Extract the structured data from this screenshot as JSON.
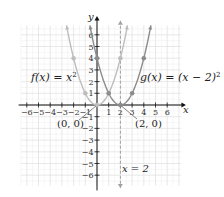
{
  "chart_data": {
    "type": "line",
    "title": "",
    "xlabel": "x",
    "ylabel": "y",
    "xlim": [
      -6.5,
      7.2
    ],
    "ylim": [
      -6.9,
      6.8
    ],
    "grid": true,
    "x_ticks": [
      -6,
      -5,
      -4,
      -3,
      -2,
      -1,
      1,
      2,
      3,
      4,
      5,
      6
    ],
    "y_ticks": [
      -6,
      -5,
      -4,
      -3,
      -2,
      -1,
      1,
      2,
      3,
      4,
      5,
      6
    ],
    "series": [
      {
        "name": "f(x) = x^2",
        "label_main": "f(x) = x",
        "label_exp": "2",
        "color": "#bdbdbd",
        "points": [
          [
            -2,
            4
          ],
          [
            -1,
            1
          ],
          [
            0,
            0
          ],
          [
            1,
            1
          ],
          [
            2,
            4
          ]
        ]
      },
      {
        "name": "g(x) = (x − 2)^2",
        "label_main": "g(x) = (x − 2)",
        "label_exp": "2",
        "color": "#8c8c8c",
        "points": [
          [
            0,
            4
          ],
          [
            1,
            1
          ],
          [
            2,
            0
          ],
          [
            3,
            1
          ],
          [
            4,
            4
          ]
        ]
      }
    ],
    "annotations": [
      {
        "text": "(0, 0)",
        "points_to": [
          0,
          0
        ]
      },
      {
        "text": "(2, 0)",
        "points_to": [
          2,
          0
        ]
      },
      {
        "text": "x = 2",
        "type": "axis-of-symmetry",
        "x": 2
      }
    ]
  },
  "labels": {
    "x_axis": "x",
    "y_axis": "y",
    "f_label": "f(x) = x",
    "f_exp": "2",
    "g_label": "g(x) = (x − 2)",
    "g_exp": "2",
    "origin_vertex": "(0, 0)",
    "shift_vertex": "(2, 0)",
    "symmetry_line": "x = 2"
  },
  "colors": {
    "axis": "#111111",
    "grid": "#e2e2e2",
    "grid_minor": "#f0f0f0",
    "f_curve": "#bdbdbd",
    "g_curve": "#8c8c8c",
    "dashed": "#a0a0a0"
  }
}
